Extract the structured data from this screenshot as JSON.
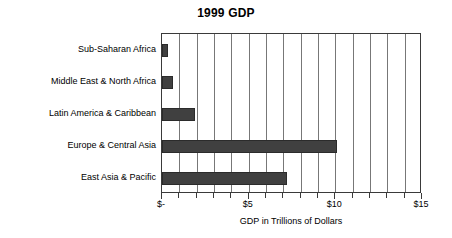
{
  "chart_data": {
    "type": "bar",
    "orientation": "horizontal",
    "title": "1999 GDP",
    "xlabel": "GDP in Trillions of Dollars",
    "ylabel": "",
    "xlim": [
      0,
      15
    ],
    "grid": true,
    "legend": "none",
    "bar_color": "#404040",
    "categories": [
      "Sub-Saharan Africa",
      "Middle East & North Africa",
      "Latin America & Caribbean",
      "Europe & Central Asia",
      "East Asia & Pacific"
    ],
    "values": [
      0.33,
      0.62,
      1.9,
      10.1,
      7.2
    ],
    "xticks": [
      0,
      5,
      10,
      15
    ],
    "xticklabels": [
      "$-",
      "$5",
      "$10",
      "$15"
    ],
    "minor_tick_interval": 1
  }
}
